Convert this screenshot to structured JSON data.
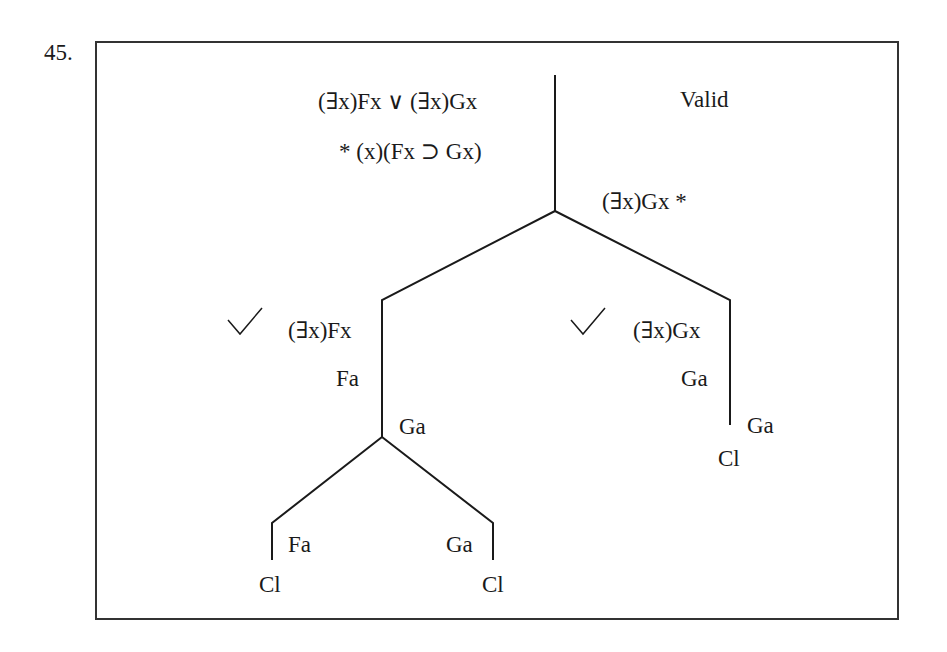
{
  "problem_number": "45.",
  "verdict": "Valid",
  "trunk": {
    "premises": [
      "(∃x)Fx ∨ (∃x)Gx",
      "* (x)(Fx ⊃ Gx)"
    ],
    "negated_conclusion": "(∃x)Gx *"
  },
  "left_branch": {
    "check": "✓",
    "lines": [
      "(∃x)Fx",
      "Fa"
    ],
    "split_label": "Ga",
    "left_leaf": {
      "line": "Fa",
      "closed": "Cl"
    },
    "right_leaf": {
      "line": "Ga",
      "closed": "Cl"
    }
  },
  "right_branch": {
    "check": "✓",
    "lines": [
      "(∃x)Gx",
      "Ga"
    ],
    "leaf_line": "Ga",
    "closed": "Cl"
  },
  "colors": {
    "ink": "#1a1a1a",
    "border": "#333333"
  }
}
